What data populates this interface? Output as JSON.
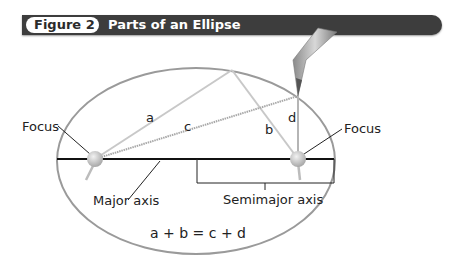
{
  "figure": {
    "number_label": "Figure 2",
    "title": "Parts of an Ellipse"
  },
  "labels": {
    "focus_left": "Focus",
    "focus_right": "Focus",
    "major_axis": "Major axis",
    "semimajor_axis": "Semimajor axis",
    "segment_a": "a",
    "segment_b": "b",
    "segment_c": "c",
    "segment_d": "d",
    "equation": "a + b = c + d"
  },
  "colors": {
    "header_bar": "#3d3d3d",
    "ellipse_stroke": "#9a9a9a",
    "axis_line": "#111111",
    "string_light": "#c4c4c4",
    "string_dark": "#a0a0a0",
    "focus_fill": "#c9c9c9"
  }
}
